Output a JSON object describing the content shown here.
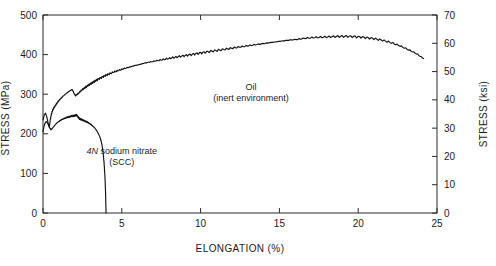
{
  "chart_data": {
    "type": "line",
    "title": "",
    "xlabel": "ELONGATION (%)",
    "ylabel": "STRESS (MPa)",
    "y2label": "STRESS (ksi)",
    "xlim": [
      0,
      25
    ],
    "ylim": [
      0,
      500
    ],
    "y2lim": [
      0,
      70
    ],
    "xticks": [
      0,
      5,
      10,
      15,
      20,
      25
    ],
    "xticklabels": [
      "0",
      "5",
      "10",
      "15",
      "20",
      "25"
    ],
    "yticks": [
      0,
      100,
      200,
      300,
      400,
      500
    ],
    "yticklabels": [
      "0",
      "100",
      "200",
      "300",
      "400",
      "500"
    ],
    "y2ticks": [
      0,
      10,
      20,
      30,
      40,
      50,
      60,
      70
    ],
    "y2ticklabels": [
      "0",
      "10",
      "20",
      "30",
      "40",
      "50",
      "60",
      "70"
    ],
    "grid": false,
    "legend": "none",
    "annotations": [
      {
        "name": "oil",
        "line1": "Oil",
        "line2": "(inert environment)",
        "x": 13.2,
        "y": 310
      },
      {
        "name": "scc",
        "line1_italic": "4N",
        "line1": " sodium nitrate",
        "line2": "(SCC)",
        "x": 5.0,
        "y": 150
      }
    ],
    "series": [
      {
        "name": "Oil (inert environment)",
        "color": "#111111",
        "x": [
          0.0,
          0.08,
          0.16,
          0.24,
          0.32,
          0.4,
          0.45,
          0.52,
          0.6,
          0.7,
          0.82,
          0.95,
          1.1,
          1.25,
          1.45,
          1.65,
          1.85,
          2.05,
          2.25,
          2.45,
          2.65,
          2.85,
          3.05,
          3.25,
          3.45,
          3.7,
          3.95,
          4.2,
          4.5,
          4.8,
          5.1,
          5.45,
          5.8,
          6.15,
          6.5,
          6.9,
          7.3,
          7.7,
          8.1,
          8.5,
          8.95,
          9.4,
          9.85,
          10.3,
          10.8,
          11.3,
          11.8,
          12.3,
          12.8,
          13.3,
          13.85,
          14.4,
          14.95,
          15.5,
          16.05,
          16.6,
          17.15,
          17.7,
          18.25,
          18.8,
          19.35,
          19.9,
          20.45,
          21.0,
          21.55,
          22.1,
          22.65,
          23.2,
          23.7,
          24.15
        ],
        "y": [
          235,
          248,
          252,
          243,
          228,
          216,
          232,
          248,
          258,
          266,
          273,
          281,
          288,
          294,
          301,
          307,
          312,
          296,
          302,
          310,
          316,
          322,
          327,
          332,
          337,
          342,
          347,
          351,
          356,
          360,
          364,
          368,
          372,
          375,
          379,
          382,
          385,
          388,
          391,
          394,
          397,
          400,
          403,
          406,
          409,
          412,
          415,
          418,
          421,
          424,
          427,
          430,
          433,
          436,
          438,
          441,
          443,
          444,
          445,
          446,
          446,
          445,
          443,
          440,
          436,
          430,
          422,
          412,
          402,
          390
        ]
      },
      {
        "name": "4N sodium nitrate (SCC)",
        "color": "#111111",
        "x": [
          0.0,
          0.06,
          0.12,
          0.2,
          0.28,
          0.35,
          0.42,
          0.5,
          0.6,
          0.72,
          0.85,
          1.0,
          1.15,
          1.32,
          1.5,
          1.68,
          1.85,
          2.0,
          2.12,
          2.22,
          2.32,
          2.45,
          2.6,
          2.78,
          2.95,
          3.12,
          3.28,
          3.42,
          3.55,
          3.66,
          3.75,
          3.82,
          3.88,
          3.93,
          3.97,
          4.0
        ],
        "y": [
          205,
          218,
          226,
          231,
          228,
          222,
          216,
          210,
          214,
          220,
          226,
          231,
          235,
          238,
          241,
          243,
          245,
          246,
          248,
          243,
          238,
          236,
          233,
          230,
          226,
          221,
          215,
          207,
          198,
          186,
          170,
          150,
          124,
          92,
          52,
          0
        ]
      }
    ]
  },
  "figure": {
    "bg_color": "#ffffff",
    "axis_color": "#2b2b2b"
  }
}
